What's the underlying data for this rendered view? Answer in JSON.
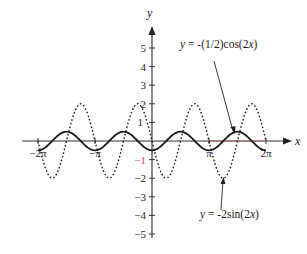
{
  "chart_data": {
    "type": "line",
    "title": "",
    "xlabel": "x",
    "ylabel": "y",
    "xlim": [
      -6.7,
      7.6
    ],
    "ylim": [
      -5,
      5.9
    ],
    "grid": false,
    "legend_position": "annotations",
    "x_ticks": [
      {
        "value": -6.2832,
        "label": "−2π"
      },
      {
        "value": -3.1416,
        "label": "−π"
      },
      {
        "value": 3.1416,
        "label": "π"
      },
      {
        "value": 6.2832,
        "label": "2π"
      }
    ],
    "y_ticks": [
      {
        "value": 5,
        "label": "5"
      },
      {
        "value": 4,
        "label": "4"
      },
      {
        "value": 3,
        "label": "3"
      },
      {
        "value": 2,
        "label": "2"
      },
      {
        "value": 1,
        "label": "1"
      },
      {
        "value": -1,
        "label": "−1"
      },
      {
        "value": -2,
        "label": "−2"
      },
      {
        "value": -3,
        "label": "−3"
      },
      {
        "value": -4,
        "label": "−4"
      },
      {
        "value": -5,
        "label": "−5"
      }
    ],
    "series": [
      {
        "name": "y = -(1/2)cos(2x)",
        "style": "solid",
        "function": "-0.5*cos(2x)",
        "domain": [
          -6.2832,
          6.2832
        ],
        "amplitude": 0.5,
        "period": 3.1416,
        "x": [
          -6.2832,
          -4.7124,
          -3.1416,
          -1.5708,
          0,
          1.5708,
          3.1416,
          4.7124,
          6.2832
        ],
        "values": [
          -0.5,
          0.5,
          -0.5,
          0.5,
          -0.5,
          0.5,
          -0.5,
          0.5,
          -0.5
        ]
      },
      {
        "name": "y = -2sin(2x)",
        "style": "dotted",
        "function": "-2*sin(2x)",
        "domain": [
          -6.2832,
          6.2832
        ],
        "amplitude": 2,
        "period": 3.1416,
        "x": [
          -6.2832,
          -5.4978,
          -3.927,
          -2.3562,
          -0.7854,
          0.7854,
          2.3562,
          3.927,
          5.4978,
          6.2832
        ],
        "values": [
          0,
          -2,
          2,
          -2,
          2,
          -2,
          2,
          -2,
          2,
          0
        ]
      }
    ],
    "annotations": [
      {
        "text": "y = -(1/2)cos(2x)",
        "points_to": "solid curve peak near x = 3π/2"
      },
      {
        "text": "y = -2sin(2x)",
        "points_to": "dotted curve trough near x = 3π/4 + π/2"
      }
    ]
  },
  "labels": {
    "x_axis": "x",
    "y_axis": "y",
    "eq_cos_var": "y",
    "eq_cos_rest": " = -(1/2)cos(2",
    "eq_cos_x": "x",
    "eq_cos_end": ")",
    "eq_sin_var": "y",
    "eq_sin_rest": " = -2sin(2",
    "eq_sin_x": "x",
    "eq_sin_end": ")"
  },
  "colors": {
    "axis": "#333333",
    "curve": "#1a1a1a",
    "neg_one_label": "#d9534f",
    "x_axis_highlight": "#c0392b"
  }
}
